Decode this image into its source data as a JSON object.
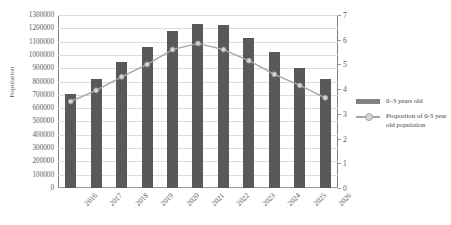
{
  "chart_data": {
    "type": "bar",
    "title": "",
    "subtitle": "",
    "xlabel": "",
    "ylabel": "Population",
    "y2label": "",
    "categories": [
      "2016",
      "2017",
      "2018",
      "2019",
      "2020",
      "2021",
      "2022",
      "2023",
      "2024",
      "2025",
      "2026"
    ],
    "ylim": [
      0,
      1300000
    ],
    "y2lim": [
      0,
      7
    ],
    "yticks": [
      "0",
      "100000",
      "200000",
      "300000",
      "400000",
      "500000",
      "600000",
      "700000",
      "800000",
      "900000",
      "1000000",
      "1100000",
      "1200000",
      "1300000"
    ],
    "y2ticks": [
      "0",
      "1",
      "2",
      "3",
      "4",
      "5",
      "6",
      "7"
    ],
    "grid": true,
    "legend_position": "right",
    "series": [
      {
        "name": "0–3 years old",
        "type": "bar",
        "axis": "left",
        "color": "#595959",
        "values": [
          705000,
          820000,
          950000,
          1060000,
          1180000,
          1230000,
          1225000,
          1130000,
          1020000,
          900000,
          820000
        ]
      },
      {
        "name": "Proportion of 0-3 year old population",
        "type": "line",
        "axis": "right",
        "color": "#a6a6a6",
        "marker_fill": "#d4d4d4",
        "values": [
          3.5,
          3.95,
          4.5,
          5.0,
          5.6,
          5.85,
          5.6,
          5.15,
          4.6,
          4.15,
          3.65
        ]
      }
    ]
  },
  "legend": {
    "items": [
      {
        "label": "0–3 years old",
        "key": "bar-swatch"
      },
      {
        "label": "Proportion of 0-3 year old population",
        "key": "line-swatch"
      }
    ]
  }
}
